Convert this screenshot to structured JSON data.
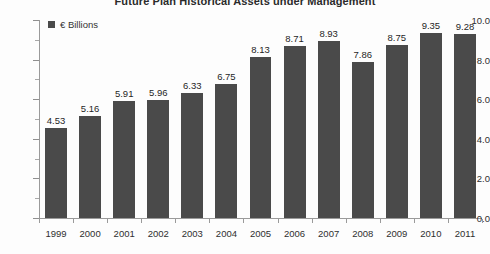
{
  "chart_data": {
    "type": "bar",
    "title": "Future Plan Historical Assets under Management",
    "xlabel": "",
    "ylabel": "",
    "ylim": [
      0,
      10
    ],
    "y_ticks": [
      "0.0",
      "2.0",
      "4.0",
      "6.0",
      "8.0",
      "10.0"
    ],
    "y_tick_values": [
      0,
      2,
      4,
      6,
      8,
      10
    ],
    "y_minor_step": 1,
    "grid": false,
    "legend_position": "top-left",
    "legend": [
      "€ Billions"
    ],
    "series_color": "#4a4a4a",
    "categories": [
      "1999",
      "2000",
      "2001",
      "2002",
      "2003",
      "2004",
      "2005",
      "2006",
      "2007",
      "2008",
      "2009",
      "2010",
      "2011"
    ],
    "values": [
      4.53,
      5.16,
      5.91,
      5.96,
      6.33,
      6.75,
      8.13,
      8.71,
      8.93,
      7.86,
      8.75,
      9.35,
      9.28
    ],
    "value_labels": [
      "4.53",
      "5.16",
      "5.91",
      "5.96",
      "6.33",
      "6.75",
      "8.13",
      "8.71",
      "8.93",
      "7.86",
      "8.75",
      "9.35",
      "9.28"
    ]
  }
}
